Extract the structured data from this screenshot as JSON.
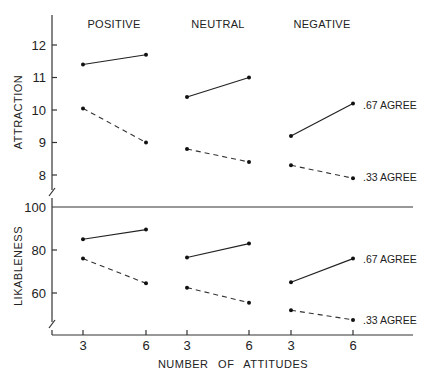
{
  "chart_data": {
    "type": "line",
    "xlabel": "NUMBER OF ATTITUDES",
    "groups": [
      "POSITIVE",
      "NEUTRAL",
      "NEGATIVE"
    ],
    "x_ticks": [
      "3",
      "6",
      "3",
      "6",
      "3",
      "6"
    ],
    "x_values": [
      3,
      6
    ],
    "legend": [
      {
        "name": ".67 AGREE",
        "style": "solid"
      },
      {
        "name": ".33 AGREE",
        "style": "dashed"
      }
    ],
    "panels": [
      {
        "ylabel": "ATTRACTION",
        "yticks": [
          8,
          9,
          10,
          11,
          12
        ],
        "ylim": [
          7.5,
          12.9
        ],
        "series": [
          {
            "name": ".67 AGREE",
            "style": "solid",
            "values": {
              "POSITIVE": [
                11.4,
                11.7
              ],
              "NEUTRAL": [
                10.4,
                11.0
              ],
              "NEGATIVE": [
                9.2,
                10.2
              ]
            }
          },
          {
            "name": ".33 AGREE",
            "style": "dashed",
            "values": {
              "POSITIVE": [
                10.05,
                9.0
              ],
              "NEUTRAL": [
                8.8,
                8.4
              ],
              "NEGATIVE": [
                8.3,
                7.9
              ]
            }
          }
        ]
      },
      {
        "ylabel": "LIKABLENESS",
        "yticks": [
          60,
          80,
          100
        ],
        "ylim": [
          45,
          100
        ],
        "series": [
          {
            "name": ".67 AGREE",
            "style": "solid",
            "values": {
              "POSITIVE": [
                85,
                89.5
              ],
              "NEUTRAL": [
                76.5,
                83
              ],
              "NEGATIVE": [
                65,
                76
              ]
            }
          },
          {
            "name": ".33 AGREE",
            "style": "dashed",
            "values": {
              "POSITIVE": [
                76,
                64.5
              ],
              "NEUTRAL": [
                62.5,
                55.5
              ],
              "NEGATIVE": [
                52,
                47.5
              ]
            }
          }
        ]
      }
    ]
  },
  "labels": {
    "group_positive": "POSITIVE",
    "group_neutral": "NEUTRAL",
    "group_negative": "NEGATIVE",
    "ylabel_top": "ATTRACTION",
    "ylabel_bottom": "LIKABLENESS",
    "xlabel": "NUMBER OF ATTITUDES",
    "legend_solid": ".67 AGREE",
    "legend_dashed": ".33 AGREE"
  }
}
